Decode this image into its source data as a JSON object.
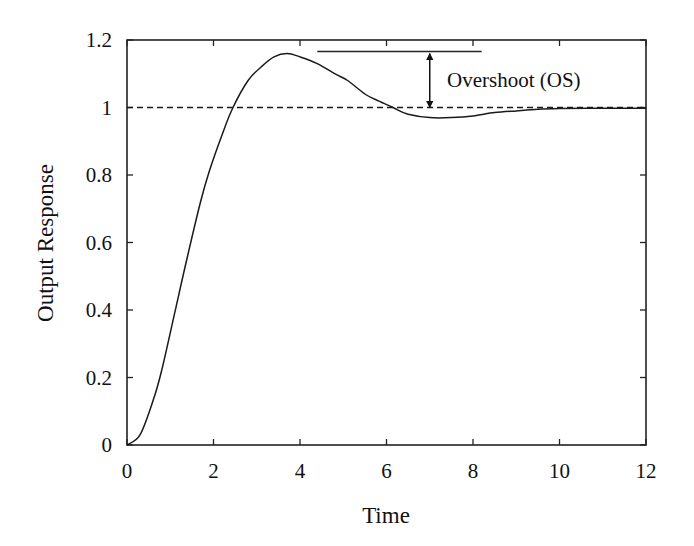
{
  "chart_data": {
    "type": "line",
    "title": "",
    "xlabel": "Time",
    "ylabel": "Output Response",
    "xlim": [
      0,
      12
    ],
    "ylim": [
      0,
      1.2
    ],
    "xticks": [
      0,
      2,
      4,
      6,
      8,
      10,
      12
    ],
    "yticks": [
      0,
      0.2,
      0.4,
      0.6,
      0.8,
      1,
      1.2
    ],
    "xtick_labels": [
      "0",
      "2",
      "4",
      "6",
      "8",
      "10",
      "12"
    ],
    "ytick_labels": [
      "0",
      "0.2",
      "0.4",
      "0.6",
      "0.8",
      "1",
      "1.2"
    ],
    "grid": false,
    "legend": null,
    "series": [
      {
        "name": "Output Response",
        "style": "solid",
        "x": [
          0,
          0.3,
          0.6,
          0.8,
          1.1,
          1.4,
          1.7,
          1.9,
          2.2,
          2.45,
          2.8,
          3.1,
          3.4,
          3.7,
          4.0,
          4.4,
          4.8,
          5.1,
          5.5,
          5.8,
          6.15,
          6.5,
          7.0,
          7.5,
          8.0,
          8.5,
          9.0,
          9.5,
          10.0,
          11.0,
          12.0
        ],
        "y": [
          0,
          0.03,
          0.13,
          0.22,
          0.39,
          0.56,
          0.72,
          0.81,
          0.92,
          1.0,
          1.08,
          1.12,
          1.15,
          1.16,
          1.15,
          1.13,
          1.1,
          1.08,
          1.04,
          1.02,
          1.0,
          0.98,
          0.97,
          0.97,
          0.975,
          0.985,
          0.99,
          0.995,
          0.997,
          0.998,
          0.998
        ]
      },
      {
        "name": "Steady-state reference",
        "style": "dashed",
        "x": [
          0,
          12
        ],
        "y": [
          1,
          1
        ]
      }
    ],
    "annotations": [
      {
        "type": "horizontal-line",
        "x": [
          4.4,
          8.2
        ],
        "y": 1.16,
        "label": ""
      },
      {
        "type": "double-arrow",
        "x": 7.0,
        "y": [
          1.16,
          1.0
        ],
        "label": "Overshoot (OS)"
      }
    ]
  },
  "labels": {
    "xlabel": "Time",
    "ylabel": "Output Response",
    "annotation": "Overshoot (OS)"
  }
}
